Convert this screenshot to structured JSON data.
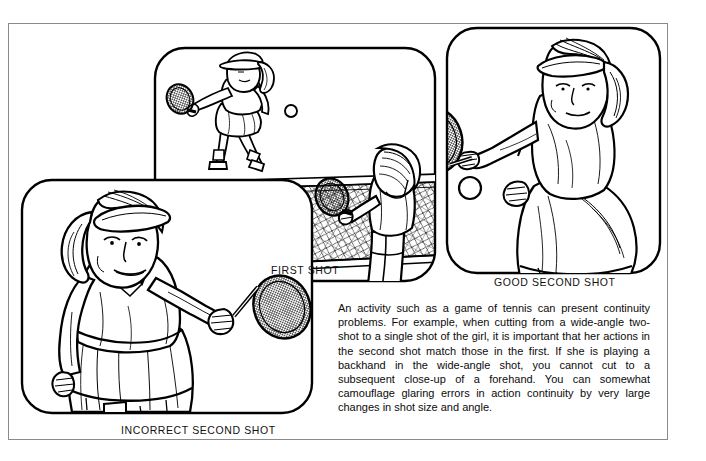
{
  "page": {
    "background_color": "#ffffff",
    "frame_color": "#8a8a8a",
    "ink_color": "#000000"
  },
  "captions": {
    "first_shot": "FIRST SHOT",
    "good_second_shot": "GOOD SECOND SHOT",
    "incorrect_second_shot": "INCORRECT SECOND SHOT"
  },
  "body_copy": {
    "text": "An activity such as a game of tennis can present continuity problems. For example, when cutting from a wide-angle two-shot to a single shot of the girl, it is important that her actions in the second shot match those in the first. If she is playing a backhand in the wide-angle shot, you cannot cut to a subsequent close-up of a forehand. You can somewhat camouflage glaring errors in action continuity by very large changes in shot size and angle."
  },
  "panels": [
    {
      "id": "first-shot",
      "caption": "FIRST SHOT",
      "description": "Wide-angle two-shot of a tennis court: a girl in the far court playing a backhand, a ball in mid-air, and a player in the near foreground at right holding a racket, with the net crossing the frame."
    },
    {
      "id": "good-second-shot",
      "caption": "GOOD SECOND SHOT",
      "description": "Close-up of the girl wearing a visor with a ponytail, racket extended to her left completing a backhand, ball near the racket face."
    },
    {
      "id": "incorrect-second-shot",
      "caption": "INCORRECT SECOND SHOT",
      "description": "Close-up of the girl wearing a visor with a ponytail, racket extended to her right in a forehand, which does not match the backhand of the first shot."
    }
  ]
}
